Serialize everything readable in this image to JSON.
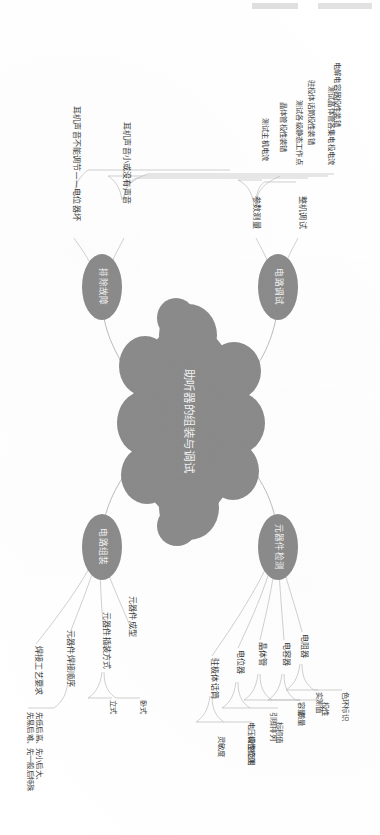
{
  "center": {
    "label": "助听器的组装与调试"
  },
  "branches": [
    {
      "id": "circuit-debug",
      "label": "电路调试",
      "children": [
        {
          "label": "整机调试",
          "children": []
        },
        {
          "label": "参数测量",
          "children": [
            {
              "label": "测试晶体管各集电极电流"
            },
            {
              "label": "测试各级静态工作点"
            },
            {
              "label": "测试主机电流"
            }
          ]
        }
      ]
    },
    {
      "id": "troubleshooting",
      "label": "排除故障",
      "children": [
        {
          "label": "耳机声音小或没有声音",
          "children": [
            {
              "label": "电解电容器极性装错"
            },
            {
              "label": "驻极体话筒极性装错"
            },
            {
              "label": "晶体管极性装错"
            }
          ]
        },
        {
          "label": "耳机声音不能调节——电位器坏",
          "children": []
        }
      ]
    },
    {
      "id": "component-test",
      "label": "元器件检测",
      "children": [
        {
          "label": "电阻器",
          "children": [
            {
              "label": "色环标识"
            },
            {
              "label": "实测值"
            }
          ]
        },
        {
          "label": "电容器",
          "children": [
            {
              "label": "极性"
            },
            {
              "label": "容量"
            }
          ]
        },
        {
          "label": "晶体管",
          "children": [
            {
              "label": "质量"
            },
            {
              "label": "引脚排列"
            }
          ]
        },
        {
          "label": "电位器",
          "children": [
            {
              "label": "标称值"
            },
            {
              "label": "电压调整范围"
            }
          ]
        },
        {
          "label": "驻极体话筒",
          "children": [
            {
              "label": "极性检测"
            },
            {
              "label": "灵敏度"
            }
          ]
        }
      ]
    },
    {
      "id": "circuit-assembly",
      "label": "电路组装",
      "children": [
        {
          "label": "元器件成型",
          "children": []
        },
        {
          "label": "元器件插装方式",
          "children": [
            {
              "label": "卧式"
            },
            {
              "label": "立式"
            }
          ]
        },
        {
          "label": "元器件焊接顺序",
          "children": [
            {
              "label": "先低后高、先小后大、\n先易后难、先一般后特殊"
            }
          ]
        },
        {
          "label": "焊接工艺要求",
          "children": []
        }
      ]
    }
  ],
  "colors": {
    "node_fill": "#8b8b8b",
    "node_text": "#f3f3f3",
    "label_text": "#3a3a3a",
    "wire": "#b0b0b0",
    "background": "#ffffff"
  }
}
